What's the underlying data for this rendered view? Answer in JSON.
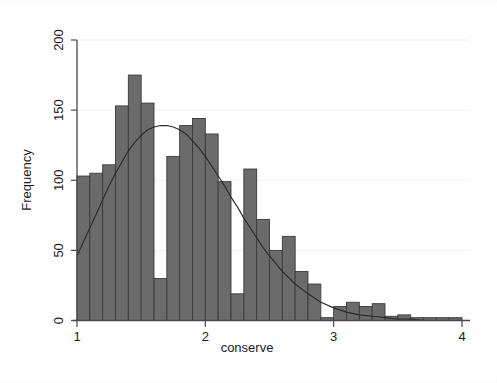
{
  "chart_data": {
    "type": "bar",
    "title": "",
    "subtitle": "",
    "xlabel": "conserve",
    "ylabel": "Frequency",
    "xlim": [
      1,
      4
    ],
    "ylim": [
      0,
      200
    ],
    "xticks": [
      1,
      2,
      3,
      4
    ],
    "xtick_labels": [
      "1",
      "2",
      "3",
      "4"
    ],
    "yticks": [
      0,
      50,
      100,
      150,
      200
    ],
    "ytick_labels": [
      "0",
      "50",
      "100",
      "150",
      "200"
    ],
    "grid": true,
    "legend": "none",
    "bin_width": 0.1,
    "bar_color": "#6b6b6b",
    "bar_edge_color": "#3a3a3a",
    "curve_color": "#2b2b2b",
    "axis_color": "#4a4a4a",
    "grid_color": "#f0f0f0",
    "background_color": "#ffffff",
    "bin_starts": [
      1.0,
      1.1,
      1.2,
      1.3,
      1.4,
      1.5,
      1.6,
      1.7,
      1.8,
      1.9,
      2.0,
      2.1,
      2.2,
      2.3,
      2.4,
      2.5,
      2.6,
      2.7,
      2.8,
      2.9,
      3.0,
      3.1,
      3.2,
      3.3,
      3.4,
      3.5,
      3.6,
      3.7,
      3.8,
      3.9
    ],
    "bin_centers": [
      1.05,
      1.15,
      1.25,
      1.35,
      1.45,
      1.55,
      1.65,
      1.75,
      1.85,
      1.95,
      2.05,
      2.15,
      2.25,
      2.35,
      2.45,
      2.55,
      2.65,
      2.75,
      2.85,
      2.95,
      3.05,
      3.15,
      3.25,
      3.35,
      3.45,
      3.55,
      3.65,
      3.75,
      3.85,
      3.95
    ],
    "categories": [
      "1.05",
      "1.15",
      "1.25",
      "1.35",
      "1.45",
      "1.55",
      "1.65",
      "1.75",
      "1.85",
      "1.95",
      "2.05",
      "2.15",
      "2.25",
      "2.35",
      "2.45",
      "2.55",
      "2.65",
      "2.75",
      "2.85",
      "2.95",
      "3.05",
      "3.15",
      "3.25",
      "3.35",
      "3.45",
      "3.55",
      "3.65",
      "3.75",
      "3.85",
      "3.95"
    ],
    "values": [
      103,
      105,
      111,
      153,
      175,
      155,
      30,
      117,
      139,
      144,
      133,
      99,
      19,
      108,
      72,
      50,
      60,
      35,
      26,
      2,
      10,
      13,
      10,
      12,
      3,
      4,
      2,
      2,
      2,
      2
    ],
    "overlay_curve": {
      "name": "normal density",
      "mean": 1.78,
      "peak_value": 139,
      "x": [
        1.0,
        1.05,
        1.1,
        1.15,
        1.2,
        1.25,
        1.3,
        1.35,
        1.4,
        1.45,
        1.5,
        1.55,
        1.6,
        1.65,
        1.7,
        1.75,
        1.8,
        1.85,
        1.9,
        1.95,
        2.0,
        2.05,
        2.1,
        2.15,
        2.2,
        2.25,
        2.3,
        2.35,
        2.4,
        2.45,
        2.5,
        2.6,
        2.7,
        2.8,
        2.9,
        3.0,
        3.1,
        3.2,
        3.3,
        3.4,
        3.5,
        3.6,
        3.7,
        3.8,
        3.9,
        4.0
      ],
      "y": [
        46,
        56,
        66,
        76,
        86,
        96,
        105,
        113,
        121,
        127,
        132,
        136,
        138,
        139,
        139,
        138,
        136,
        133,
        128,
        123,
        117,
        110,
        103,
        96,
        88,
        81,
        73,
        66,
        59,
        52,
        46,
        35,
        26,
        19,
        13,
        9,
        6,
        4,
        3,
        2,
        1,
        1,
        0,
        0,
        0,
        0
      ]
    }
  },
  "axis": {
    "y_title": "Frequency",
    "x_title": "conserve"
  }
}
